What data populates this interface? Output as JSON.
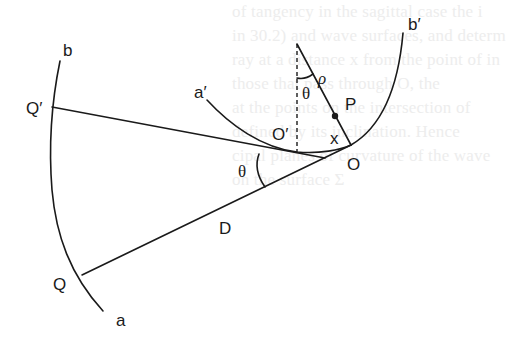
{
  "figure": {
    "labels": {
      "b": "b",
      "b_prime": "b′",
      "a": "a",
      "a_prime": "a′",
      "Q_prime": "Q′",
      "Q": "Q",
      "O": "O",
      "O_prime": "O′",
      "P": "P",
      "x": "x",
      "rho": "ρ",
      "theta_top": "θ",
      "theta_bottom": "θ",
      "D": "D"
    },
    "colors": {
      "ink": "#1a1a1a",
      "background": "#ffffff",
      "show_through_text": "#ededed"
    }
  },
  "show_through_text": [
    "of tangency in the sagittal case the i",
    "in 30.2) and wave surfaces, and determ",
    "ray at a distance x from the point of in",
    "those that pass through O, the",
    "at the points on the intersection of",
    "defined by its inclination. Hence",
    "cipal planes of curvature of the wave",
    "on the surface Σ"
  ]
}
